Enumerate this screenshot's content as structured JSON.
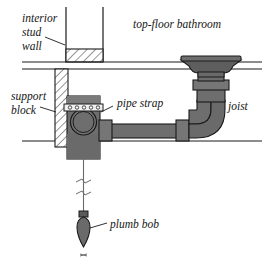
{
  "figure": {
    "background_color": "#ffffff",
    "ink_color": "#1a1a1a",
    "pipe_fill_color": "#6e6e6e",
    "pipe_shade_color": "#595959",
    "box_fill_color": "#6e6e6e",
    "strap_fill_color": "#4a4a4a",
    "hatch_color": "#1a1a1a"
  },
  "labels": {
    "interior_stud_wall": {
      "line1": "interior",
      "line2": "stud",
      "line3": "wall"
    },
    "top_floor_bathroom": "top-floor bathroom",
    "support_block": {
      "line1": "support",
      "line2": "block"
    },
    "pipe_strap": "pipe strap",
    "joist": "joist",
    "plumb_bob": "plumb bob"
  },
  "components": {
    "stud_wall": "interior stud wall with hatched sole plate",
    "floor_assembly": "two parallel horizontal floor lines",
    "support_block": "vertical hatched support block",
    "junction_box": "drain fitting body with large circular hub",
    "pipe_strap": "perforated metal strap with fastener holes",
    "strap_hole_count": 5,
    "horizontal_pipe": "horizontal drain pipe with couplings at both ends",
    "elbow": "ninety degree pipe elbow",
    "vertical_pipe": "vertical riser pipe with coupling",
    "drain_flange": "flared drain flange at bathroom floor",
    "joist_line": "lower horizontal joist line",
    "plumb_line": "plumb bob string with two break marks",
    "plumb_bob": "pointed plumb bob weight with cap"
  }
}
